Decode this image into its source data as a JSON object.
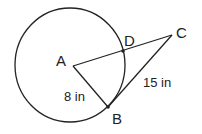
{
  "diagram": {
    "points": {
      "A": {
        "label": "A",
        "x": 73,
        "y": 66
      },
      "B": {
        "label": "B",
        "x": 108,
        "y": 107
      },
      "C": {
        "label": "C",
        "x": 172,
        "y": 35
      },
      "D": {
        "label": "D",
        "x": 123,
        "y": 51
      }
    },
    "circle": {
      "cx": 70,
      "cy": 65,
      "r": 56
    },
    "measurements": {
      "AB": "8 in",
      "BC": "15 in"
    },
    "colors": {
      "stroke": "#222222",
      "background": "#ffffff"
    }
  }
}
